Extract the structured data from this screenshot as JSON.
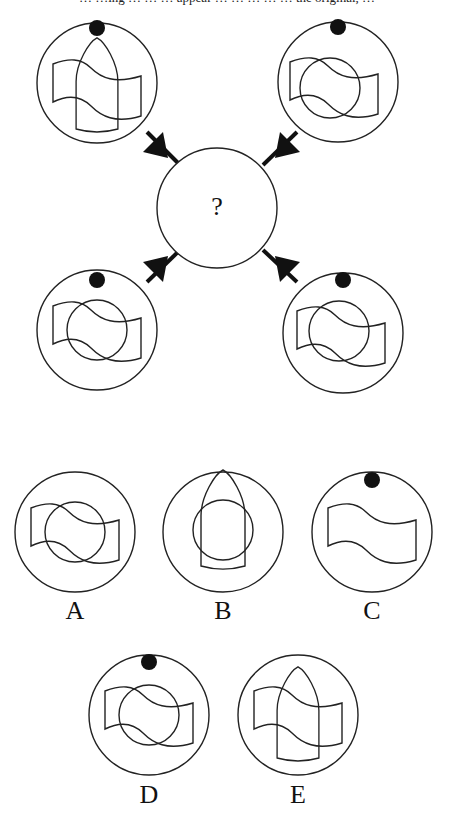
{
  "header": {
    "caption_fragment": "… …ing … … … appear … … … … … the original, …"
  },
  "puzzle": {
    "center_symbol": "?",
    "corner_figures": [
      {
        "position": "top-left",
        "dot": true,
        "inner": [
          "wave-flag",
          "bullet"
        ]
      },
      {
        "position": "top-right",
        "dot": true,
        "inner": [
          "wave-flag",
          "circle"
        ]
      },
      {
        "position": "bottom-left",
        "dot": true,
        "inner": [
          "wave-flag",
          "circle"
        ]
      },
      {
        "position": "bottom-right",
        "dot": true,
        "inner": [
          "wave-flag",
          "circle"
        ]
      }
    ]
  },
  "options": [
    {
      "label": "A",
      "dot": false,
      "inner": [
        "wave-flag",
        "circle"
      ]
    },
    {
      "label": "B",
      "dot": false,
      "inner": [
        "bullet",
        "circle"
      ]
    },
    {
      "label": "C",
      "dot": true,
      "inner": [
        "wave-flag"
      ]
    },
    {
      "label": "D",
      "dot": true,
      "inner": [
        "wave-flag",
        "circle"
      ]
    },
    {
      "label": "E",
      "dot": false,
      "inner": [
        "wave-flag",
        "bullet"
      ]
    }
  ],
  "colors": {
    "stroke": "#222222",
    "fill": "#111111",
    "background": "#ffffff"
  }
}
